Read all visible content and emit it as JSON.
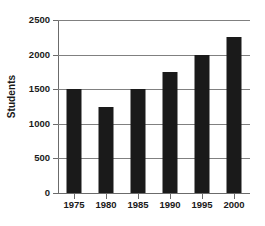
{
  "chart_data": {
    "type": "bar",
    "title": "",
    "xlabel": "",
    "ylabel": "Students",
    "categories": [
      "1975",
      "1980",
      "1985",
      "1990",
      "1995",
      "2000"
    ],
    "values": [
      1500,
      1250,
      1500,
      1750,
      2000,
      2250
    ],
    "series": [
      {
        "name": "Students",
        "values": [
          1500,
          1250,
          1500,
          1750,
          2000,
          2250
        ]
      }
    ],
    "ylim": [
      0,
      2500
    ],
    "yticks": [
      0,
      500,
      1000,
      1500,
      2000,
      2500
    ],
    "ytick_labels": [
      "0",
      "500",
      "1000",
      "1500",
      "2000",
      "2500"
    ],
    "grid": true,
    "grid_axis": "y",
    "legend": false,
    "legend_position": "none",
    "bar_color": "#1a1a1a",
    "gridline_color": "#808080",
    "axis_color": "#6b6b6b",
    "background_color": "#ffffff"
  }
}
